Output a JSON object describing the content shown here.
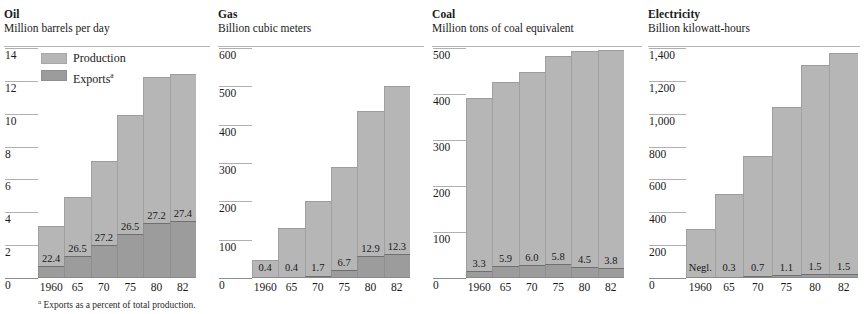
{
  "footnote": {
    "marker": "a",
    "text": "Exports as a percent of total production."
  },
  "legend": {
    "production_label": "Production",
    "exports_label": "Exports",
    "exports_marker": "a",
    "production_color": "#b6b6b6",
    "exports_color": "#9c9c9c"
  },
  "panels": [
    {
      "key": "oil",
      "title": "Oil",
      "subtitle": "Million barrels per day",
      "ticks": [
        "14",
        "12",
        "10",
        "8",
        "6",
        "4",
        "2",
        "0"
      ],
      "xlabels": [
        "1960",
        "65",
        "70",
        "75",
        "80",
        "82"
      ],
      "pct_labels": [
        "22.4",
        "26.5",
        "27.2",
        "26.5",
        "27.2",
        "27.4"
      ]
    },
    {
      "key": "gas",
      "title": "Gas",
      "subtitle": "Billion cubic meters",
      "ticks": [
        "600",
        "500",
        "400",
        "300",
        "200",
        "100",
        "0"
      ],
      "xlabels": [
        "1960",
        "65",
        "70",
        "75",
        "80",
        "82"
      ],
      "pct_labels": [
        "0.4",
        "0.4",
        "1.7",
        "6.7",
        "12.9",
        "12.3"
      ]
    },
    {
      "key": "coal",
      "title": "Coal",
      "subtitle": "Million tons of coal equivalent",
      "ticks": [
        "500",
        "400",
        "300",
        "200",
        "100",
        "0"
      ],
      "xlabels": [
        "1960",
        "65",
        "70",
        "75",
        "80",
        "82"
      ],
      "pct_labels": [
        "3.3",
        "5.9",
        "6.0",
        "5.8",
        "4.5",
        "3.8"
      ]
    },
    {
      "key": "electricity",
      "title": "Electricity",
      "subtitle": "Billion kilowatt-hours",
      "ticks": [
        "1,400",
        "1,200",
        "1,000",
        "800",
        "600",
        "400",
        "200",
        "0"
      ],
      "xlabels": [
        "1960",
        "65",
        "70",
        "75",
        "80",
        "82"
      ],
      "pct_labels": [
        "Negl.",
        "0.3",
        "0.7",
        "1.1",
        "1.5",
        "1.5"
      ]
    }
  ],
  "chart_data": [
    {
      "type": "bar",
      "title": "Oil",
      "subtitle": "Million barrels per day",
      "xlabel": "",
      "ylabel": "Million barrels per day",
      "categories": [
        "1960",
        "65",
        "70",
        "75",
        "80",
        "82"
      ],
      "ylim": [
        0,
        14
      ],
      "yticks": [
        0,
        2,
        4,
        6,
        8,
        10,
        12,
        14
      ],
      "grid": "y-ticks-in-gutter-only",
      "legend": "inside-top-left",
      "series": [
        {
          "name": "Production",
          "values": [
            3.1,
            4.9,
            7.1,
            9.9,
            12.2,
            12.4
          ]
        },
        {
          "name": "Exports",
          "values": [
            0.69,
            1.3,
            1.93,
            2.62,
            3.32,
            3.4
          ]
        }
      ],
      "annotations": [
        "22.4",
        "26.5",
        "27.2",
        "26.5",
        "27.2",
        "27.4"
      ],
      "annotation_meaning": "Exports as a percent of total production"
    },
    {
      "type": "bar",
      "title": "Gas",
      "subtitle": "Billion cubic meters",
      "xlabel": "",
      "ylabel": "Billion cubic meters",
      "categories": [
        "1960",
        "65",
        "70",
        "75",
        "80",
        "82"
      ],
      "ylim": [
        0,
        600
      ],
      "yticks": [
        0,
        100,
        200,
        300,
        400,
        500,
        600
      ],
      "grid": "y-ticks-in-gutter-only",
      "legend": "none",
      "series": [
        {
          "name": "Production",
          "values": [
            45,
            128,
            198,
            289,
            435,
            501
          ]
        },
        {
          "name": "Exports",
          "values": [
            0.2,
            0.5,
            3.4,
            19.4,
            56.1,
            61.6
          ]
        }
      ],
      "annotations": [
        "0.4",
        "0.4",
        "1.7",
        "6.7",
        "12.9",
        "12.3"
      ],
      "annotation_meaning": "Exports as a percent of total production"
    },
    {
      "type": "bar",
      "title": "Coal",
      "subtitle": "Million tons of coal equivalent",
      "xlabel": "",
      "ylabel": "Million tons of coal equivalent",
      "categories": [
        "1960",
        "65",
        "70",
        "75",
        "80",
        "82"
      ],
      "ylim": [
        0,
        500
      ],
      "yticks": [
        0,
        100,
        200,
        300,
        400,
        500
      ],
      "grid": "y-ticks-in-gutter-only",
      "legend": "none",
      "series": [
        {
          "name": "Production",
          "values": [
            390,
            425,
            447,
            483,
            493,
            495
          ]
        },
        {
          "name": "Exports",
          "values": [
            12.9,
            25.1,
            26.8,
            28.0,
            22.2,
            18.8
          ]
        }
      ],
      "annotations": [
        "3.3",
        "5.9",
        "6.0",
        "5.8",
        "4.5",
        "3.8"
      ],
      "annotation_meaning": "Exports as a percent of total production"
    },
    {
      "type": "bar",
      "title": "Electricity",
      "subtitle": "Billion kilowatt-hours",
      "xlabel": "",
      "ylabel": "Billion kilowatt-hours",
      "categories": [
        "1960",
        "65",
        "70",
        "75",
        "80",
        "82"
      ],
      "ylim": [
        0,
        1400
      ],
      "yticks": [
        0,
        200,
        400,
        600,
        800,
        1000,
        1200,
        1400
      ],
      "grid": "y-ticks-in-gutter-only",
      "legend": "none",
      "series": [
        {
          "name": "Production",
          "values": [
            292,
            507,
            741,
            1039,
            1295,
            1367
          ]
        },
        {
          "name": "Exports",
          "values": [
            0,
            1.5,
            5.2,
            11.4,
            19.4,
            20.5
          ]
        }
      ],
      "annotations": [
        "Negl.",
        "0.3",
        "0.7",
        "1.1",
        "1.5",
        "1.5"
      ],
      "annotation_meaning": "Exports as a percent of total production"
    }
  ]
}
